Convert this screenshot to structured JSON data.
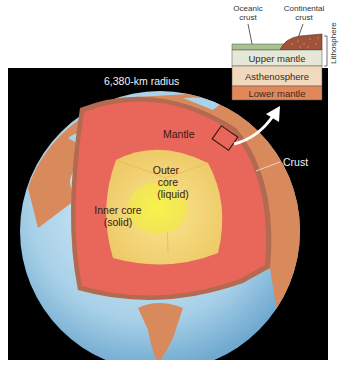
{
  "diagram": {
    "title_radius": "6,380-km radius",
    "labels": {
      "mantle": "Mantle",
      "crust": "Crust",
      "outer_core_line1": "Outer",
      "outer_core_line2": "core",
      "outer_core_line3": "(liquid)",
      "inner_core_line1": "Inner core",
      "inner_core_line2": "(solid)"
    },
    "inset": {
      "oceanic_crust_line1": "Oceanic",
      "oceanic_crust_line2": "crust",
      "continental_crust_line1": "Continental",
      "continental_crust_line2": "crust",
      "lithosphere": "Lithosphere",
      "layers": [
        "Upper mantle",
        "Asthenosphere",
        "Lower mantle"
      ]
    },
    "colors": {
      "background": "#000000",
      "ocean": "#a9d3ea",
      "crust": "#d98a5c",
      "mantle": "#e8675a",
      "outer_core": "#f3d77a",
      "inner_core": "#f4f04a",
      "upper_mantle": "#e5e8d8",
      "asthenosphere": "#f1d9bd",
      "lower_mantle": "#e2875a",
      "oceanic_crust": "#a9c08f"
    }
  }
}
